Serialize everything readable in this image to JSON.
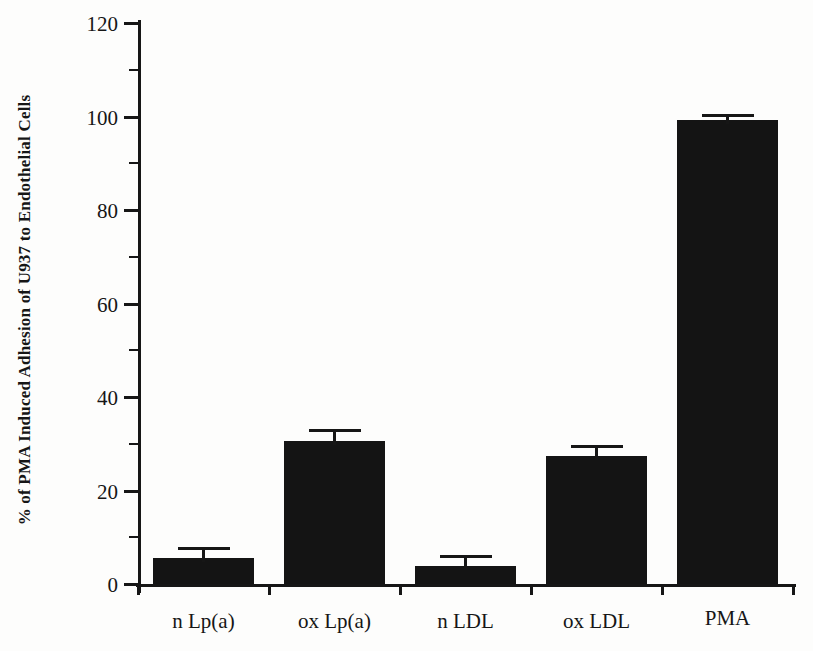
{
  "chart_data": {
    "type": "bar",
    "title": "",
    "ylabel": "% of PMA Induced Adhesion of U937 to Endothelial Cells",
    "xlabel": "",
    "categories": [
      "n Lp(a)",
      "ox Lp(a)",
      "n LDL",
      "ox LDL",
      "PMA"
    ],
    "values": [
      5.6,
      30.6,
      3.8,
      27.3,
      99.3
    ],
    "errors": [
      2.3,
      2.5,
      2.4,
      2.4,
      1.2
    ],
    "ylim": [
      0,
      120
    ],
    "ytick_step": 20,
    "yminor_step": 10,
    "ytick_labels": [
      "0",
      "20",
      "40",
      "60",
      "80",
      "100",
      "120"
    ],
    "grid": "off",
    "legend": "none",
    "bar_color": "#141414",
    "axis_color": "#161616",
    "background_color": "#fdfdfc"
  }
}
